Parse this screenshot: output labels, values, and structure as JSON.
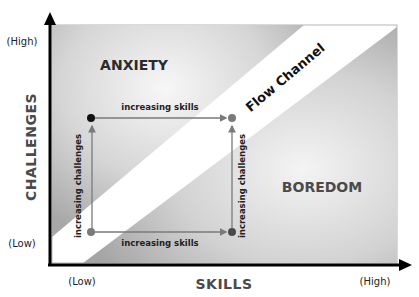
{
  "diagram": {
    "type": "flow-channel-model",
    "axes": {
      "y_label": "CHALLENGES",
      "y_high": "(High)",
      "y_low": "(Low)",
      "x_label": "SKILLS",
      "x_low": "(Low)",
      "x_high": "(High)"
    },
    "regions": {
      "anxiety": "ANXIETY",
      "flow": "Flow Channel",
      "boredom": "BOREDOM"
    },
    "arrows": {
      "top": "increasing skills",
      "bottom": "increasing skills",
      "left": "increasing challenges",
      "right": "increasing challenges"
    },
    "points": [
      {
        "name": "low-skill-high-challenge",
        "color": "#111111"
      },
      {
        "name": "high-skill-high-challenge",
        "color": "#7a7a7a"
      },
      {
        "name": "low-skill-low-challenge",
        "color": "#7a7a7a"
      },
      {
        "name": "high-skill-low-challenge",
        "color": "#4a4a4a"
      }
    ],
    "colors": {
      "region_fill_light": "#e8e8e8",
      "region_fill_dark": "#a9a9a9",
      "flow_band": "#ffffff",
      "axis": "#000000",
      "arrow_line": "#7a7a7a"
    }
  }
}
